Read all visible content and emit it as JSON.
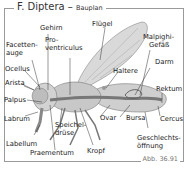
{
  "title": {
    "main": "F. Diptera",
    "dash": " – ",
    "sub": "Bauplan"
  },
  "caption": "Abb. 36.91",
  "labels": {
    "gehirn": "Gehirn",
    "fluegel": "Flügel",
    "facettenauge_1": "Facetten-",
    "facettenauge_2": "auge",
    "proventriculus_1": "Pro-",
    "proventriculus_2": "ventriculus",
    "malpighi_1": "Malpighi-",
    "malpighi_2": "Gefäß",
    "ocellus": "Ocellus",
    "darm": "Darm",
    "haltere": "Haltere",
    "arista": "Arista",
    "rektum": "Rektum",
    "palpus": "Palpus",
    "labrum": "Labrum",
    "speicheldruese_1": "Speichel-",
    "speicheldruese_2": "drüse",
    "ovar": "Ovar",
    "bursa": "Bursa",
    "cercus": "Cercus",
    "labellum": "Labellum",
    "praementum": "Praementum",
    "kropf": "Kropf",
    "geschlecht_1": "Geschlechts-",
    "geschlecht_2": "öffnung"
  },
  "colors": {
    "body": "#c8c8c8",
    "gut": "#8a8a8a",
    "wing": "#d6d6d6",
    "line": "#333333"
  }
}
